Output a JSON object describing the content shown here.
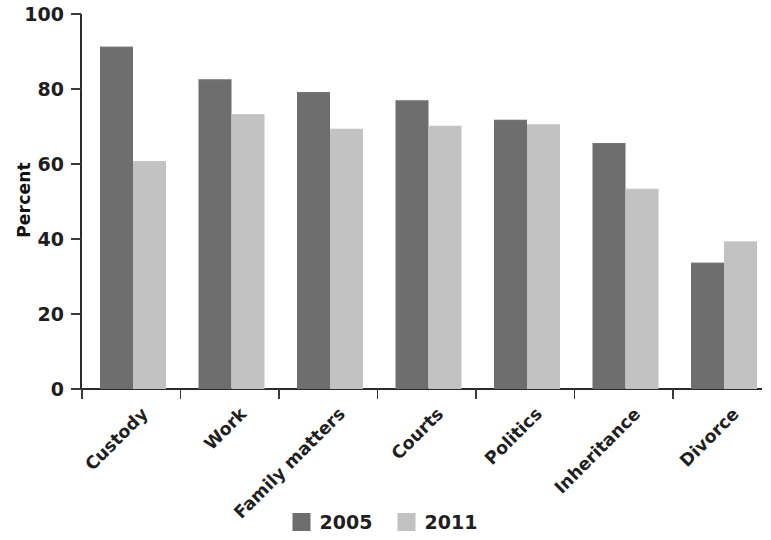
{
  "chart_data": {
    "type": "bar",
    "title": "",
    "subtitle": "",
    "xlabel": "",
    "ylabel": "Percent",
    "ylim": [
      0,
      100
    ],
    "yticks": [
      0,
      20,
      40,
      60,
      80,
      100
    ],
    "ytick_labels": [
      "0",
      "20",
      "40",
      "60",
      "80",
      "100"
    ],
    "grid": false,
    "legend_position": "bottom-center",
    "categories": [
      "Custody",
      "Work",
      "Family matters",
      "Courts",
      "Politics",
      "Inheritance",
      "Divorce"
    ],
    "series": [
      {
        "name": "2005",
        "color": "#6e6e6e",
        "values": [
          91.3,
          82.6,
          79.2,
          77.0,
          71.8,
          65.6,
          33.7
        ]
      },
      {
        "name": "2011",
        "color": "#c2c2c2",
        "values": [
          60.8,
          73.3,
          69.4,
          70.2,
          70.6,
          53.4,
          39.4
        ]
      }
    ]
  },
  "axis": {
    "y_title": "Percent",
    "y_tick_labels": [
      "100",
      "80",
      "60",
      "40",
      "20",
      "0"
    ]
  },
  "legend": {
    "items": [
      {
        "label": "2005",
        "color": "#6e6e6e"
      },
      {
        "label": "2011",
        "color": "#c2c2c2"
      }
    ]
  }
}
